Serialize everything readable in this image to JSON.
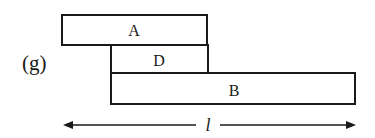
{
  "figure": {
    "panel_label": "(g)",
    "colors": {
      "stroke": "#1a1a1a",
      "fill": "#ffffff",
      "text": "#1a1a1a"
    },
    "blocks": [
      {
        "id": "A",
        "label": "A",
        "x": 62,
        "y": 15,
        "w": 145,
        "h": 30
      },
      {
        "id": "D",
        "label": "D",
        "x": 111,
        "y": 45,
        "w": 97,
        "h": 28
      },
      {
        "id": "B",
        "label": "B",
        "x": 111,
        "y": 73,
        "w": 244,
        "h": 31
      }
    ],
    "dimension": {
      "label": "l",
      "x1": 63,
      "x2": 356,
      "y": 125
    }
  }
}
